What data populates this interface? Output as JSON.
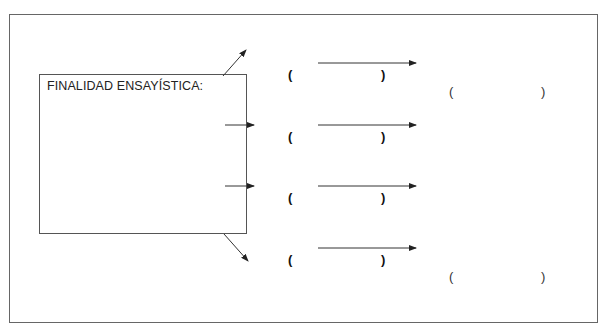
{
  "diagram": {
    "box_title": "FINALIDAD ENSAYÍSTICA:",
    "rows": [
      {
        "open": "(",
        "close": ")"
      },
      {
        "open": "(",
        "close": ")"
      },
      {
        "open": "(",
        "close": ")"
      },
      {
        "open": "(",
        "close": ")"
      }
    ],
    "results": [
      {
        "open": "(",
        "close": ")"
      },
      {
        "open": "(",
        "close": ")"
      }
    ],
    "colors": {
      "line": "#222222",
      "frame": "#666666"
    }
  }
}
